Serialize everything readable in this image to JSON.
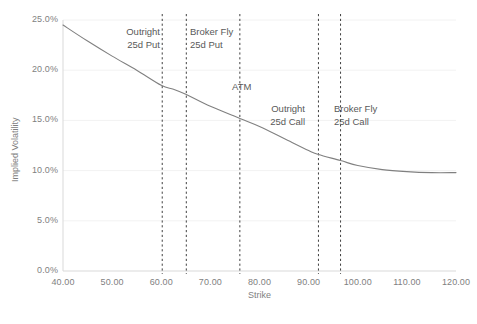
{
  "chart_data": {
    "type": "line",
    "title": "",
    "xlabel": "Strike",
    "ylabel": "Implied Volatility",
    "xlim": [
      40,
      120
    ],
    "ylim": [
      0,
      0.25
    ],
    "grid": "horizontal-faint",
    "legend": "none",
    "xticks": [
      "40.00",
      "50.00",
      "60.00",
      "70.00",
      "80.00",
      "90.00",
      "100.00",
      "110.00",
      "120.00"
    ],
    "xtick_values": [
      40,
      50,
      60,
      70,
      80,
      90,
      100,
      110,
      120
    ],
    "yticks": [
      "0.0%",
      "5.0%",
      "10.0%",
      "15.0%",
      "20.0%",
      "25.0%"
    ],
    "ytick_values": [
      0,
      0.05,
      0.1,
      0.15,
      0.2,
      0.25
    ],
    "series": [
      {
        "name": "Implied Volatility Smile",
        "color": "#808080",
        "x": [
          40,
          45,
          50,
          55,
          60,
          62.5,
          65,
          70,
          76,
          80,
          85,
          90,
          92,
          96.5,
          100,
          105,
          110,
          115,
          120
        ],
        "values": [
          0.245,
          0.229,
          0.214,
          0.2,
          0.185,
          0.181,
          0.176,
          0.164,
          0.152,
          0.144,
          0.132,
          0.12,
          0.116,
          0.11,
          0.105,
          0.101,
          0.099,
          0.098,
          0.098
        ]
      }
    ],
    "annotations": [
      {
        "id": "outright-25d-put",
        "strike": 60.2,
        "line1": "Outright",
        "line2": "25d Put",
        "align": "right",
        "label_x": 160,
        "label_y": 26
      },
      {
        "id": "broker-fly-25d-put",
        "strike": 65.1,
        "line1": "Broker Fly",
        "line2": "25d Put",
        "align": "left",
        "label_x": 190,
        "label_y": 26
      },
      {
        "id": "atm",
        "strike": 76.0,
        "line1": "ATM",
        "line2": "",
        "align": "left",
        "label_x": 232,
        "label_y": 81
      },
      {
        "id": "outright-25d-call",
        "strike": 92.0,
        "line1": "Outright",
        "line2": "25d Call",
        "align": "right",
        "label_x": 305,
        "label_y": 103
      },
      {
        "id": "broker-fly-25d-call",
        "strike": 96.5,
        "line1": "Broker Fly",
        "line2": "25d Call",
        "align": "left",
        "label_x": 334,
        "label_y": 103
      }
    ]
  },
  "axis": {
    "y_title": "Implied Volatility",
    "x_title": "Strike"
  },
  "caption": {
    "text": ""
  },
  "colors": {
    "curve": "#808080",
    "axis": "#d9d9d9",
    "gridline": "#f2f2f2",
    "dashed_line": "#404040",
    "tick_text": "#7f7f7f",
    "annotation_text": "#595959"
  }
}
